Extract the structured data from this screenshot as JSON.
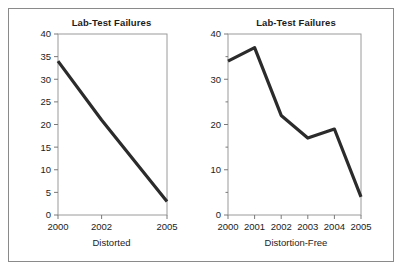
{
  "figure": {
    "background_color": "#ffffff",
    "frame_color": "#8a8a8a",
    "line_color": "#2b2b2b",
    "axis_color": "#9a9a9a",
    "text_color": "#1c1c1c"
  },
  "panels": {
    "left": {
      "title": "Lab-Test Failures",
      "caption": "Distorted"
    },
    "right": {
      "title": "Lab-Test Failures",
      "caption": "Distortion-Free"
    }
  },
  "chart_data": [
    {
      "type": "line",
      "title": "Lab-Test Failures",
      "xlabel": "Distorted",
      "ylabel": "",
      "categories": [
        "2000",
        "2002",
        "2005"
      ],
      "x": [
        2000,
        2002,
        2005
      ],
      "values": [
        34,
        21,
        3
      ],
      "xtick_labels": [
        "2000",
        "2002",
        "2005"
      ],
      "xtick_values": [
        2000,
        2002,
        2005
      ],
      "ytick_labels": [
        "0",
        "5",
        "10",
        "15",
        "20",
        "25",
        "30",
        "35",
        "40"
      ],
      "ytick_values": [
        0,
        5,
        10,
        15,
        20,
        25,
        30,
        35,
        40
      ],
      "ylim": [
        0,
        40
      ],
      "xlim": [
        2000,
        2005
      ],
      "grid": false,
      "legend": "none",
      "note": "x-axis ticks unevenly sampled (2000, 2002, 2005) which distorts the trend into a near-straight decline"
    },
    {
      "type": "line",
      "title": "Lab-Test Failures",
      "xlabel": "Distortion-Free",
      "ylabel": "",
      "categories": [
        "2000",
        "2001",
        "2002",
        "2003",
        "2004",
        "2005"
      ],
      "x": [
        2000,
        2001,
        2002,
        2003,
        2004,
        2005
      ],
      "values": [
        34,
        37,
        22,
        17,
        19,
        4
      ],
      "xtick_labels": [
        "2000",
        "2001",
        "2002",
        "2003",
        "2004",
        "2005"
      ],
      "xtick_values": [
        2000,
        2001,
        2002,
        2003,
        2004,
        2005
      ],
      "ytick_labels": [
        "0",
        "10",
        "20",
        "30",
        "40"
      ],
      "ytick_values": [
        0,
        10,
        20,
        30,
        40
      ],
      "ylim": [
        0,
        40
      ],
      "xlim": [
        2000,
        2005
      ],
      "grid": false,
      "legend": "none",
      "note": "all years shown at even spacing revealing the 2001 peak and 2004 uptick"
    }
  ]
}
